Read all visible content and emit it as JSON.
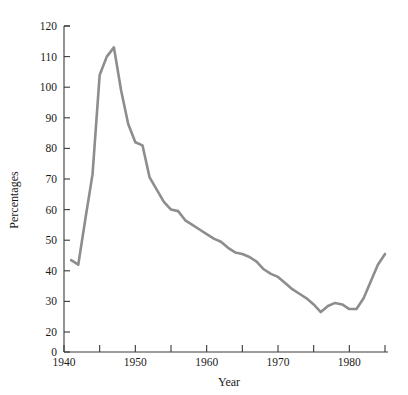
{
  "chart_data": {
    "type": "line",
    "title": "",
    "xlabel": "Year",
    "ylabel": "Percentages",
    "xlim": [
      1940,
      1985
    ],
    "ylim": [
      20,
      120
    ],
    "y_axis_break_at_zero": true,
    "grid": false,
    "legend": "none",
    "line_color": "#8d8d8d",
    "axis_color": "#3a3a3a",
    "x_ticks": [
      1940,
      1945,
      1950,
      1955,
      1960,
      1965,
      1970,
      1975,
      1980,
      1985
    ],
    "x_tick_labels": [
      "1940",
      "",
      "1950",
      "",
      "1960",
      "",
      "1970",
      "",
      "1980",
      ""
    ],
    "y_ticks": [
      0,
      20,
      30,
      40,
      50,
      60,
      70,
      80,
      90,
      100,
      110,
      120
    ],
    "y_tick_labels": [
      "0",
      "20",
      "30",
      "40",
      "50",
      "60",
      "70",
      "80",
      "90",
      "100",
      "110",
      "120"
    ],
    "x": [
      1941,
      1942,
      1943,
      1944,
      1945,
      1946,
      1947,
      1948,
      1949,
      1950,
      1951,
      1952,
      1953,
      1954,
      1955,
      1956,
      1957,
      1958,
      1959,
      1960,
      1961,
      1962,
      1963,
      1964,
      1965,
      1966,
      1967,
      1968,
      1969,
      1970,
      1971,
      1972,
      1973,
      1974,
      1975,
      1976,
      1977,
      1978,
      1979,
      1980,
      1981,
      1982,
      1983,
      1984,
      1985
    ],
    "values": [
      43.5,
      42.0,
      57.0,
      71.5,
      104.0,
      110.0,
      113.0,
      99.0,
      88.0,
      82.0,
      81.0,
      70.5,
      66.5,
      62.5,
      60.0,
      59.5,
      56.5,
      55.0,
      53.5,
      52.0,
      50.5,
      49.5,
      47.5,
      46.0,
      45.5,
      44.5,
      43.0,
      40.5,
      39.0,
      38.0,
      36.0,
      34.0,
      32.5,
      31.0,
      29.0,
      26.5,
      28.5,
      29.5,
      29.0,
      27.5,
      27.5,
      31.0,
      36.5,
      42.0,
      45.5
    ]
  }
}
